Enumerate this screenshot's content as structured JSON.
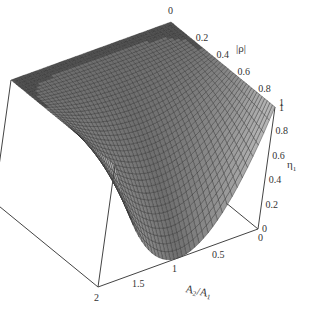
{
  "chart_data": {
    "type": "surface3d",
    "title": "",
    "x_axis": {
      "label": "A2/A1",
      "label_main": "A",
      "label_sub1": "2",
      "label_sub2": "1",
      "range": [
        0,
        2
      ],
      "ticks": [
        "0",
        "0.5",
        "1",
        "1.5",
        "2"
      ]
    },
    "y_axis": {
      "label": "|ρ|",
      "range": [
        0,
        1
      ],
      "ticks": [
        "0",
        "0.2",
        "0.4",
        "0.6",
        "0.8",
        "1"
      ]
    },
    "z_axis": {
      "label": "η1",
      "label_main": "η",
      "label_sub": "1",
      "range": [
        0,
        1
      ],
      "ticks": [
        "0",
        "0.2",
        "0.4",
        "0.6",
        "0.8",
        "1"
      ]
    },
    "surface": {
      "description": "η1 equals 1 over a flat region (small |ρ| or large A2/A1 relative to |ρ|) and dips into a parabolic valley reaching 0 at A2/A1 = 1, |ρ| = 1",
      "grid_n": 40,
      "min_value": 0,
      "max_value": 1
    },
    "colors": {
      "surface": "#5a5a5a",
      "mesh": "#2a2a2a",
      "edge": "#444444"
    }
  }
}
